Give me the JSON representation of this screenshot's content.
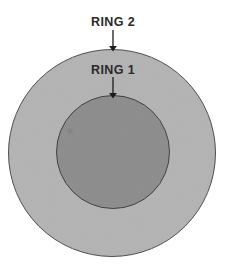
{
  "figure": {
    "type": "concentric-ring-diagram",
    "background_color": "#ffffff",
    "width": 227,
    "height": 266
  },
  "shapes": {
    "outer_ring": {
      "name": "RING 2",
      "fill_color": "#b3b3b3",
      "stroke_color": "#4a4a4a",
      "center_x": 112,
      "center_y": 153,
      "radius": 104
    },
    "inner_ring": {
      "name": "RING 1",
      "fill_color": "#8c8c8c",
      "stroke_color": "#3c3c3c",
      "center_x": 113,
      "center_y": 152,
      "radius": 57
    }
  },
  "annotations": [
    {
      "id": "ring-2",
      "label": "RING 2",
      "label_x": 113,
      "label_y": 26,
      "arrow_x": 113,
      "arrow_start_y": 30,
      "arrow_end_y": 49,
      "arrow_color": "#1c1c1c"
    },
    {
      "id": "ring-1",
      "label": "RING 1",
      "label_x": 113,
      "label_y": 74,
      "arrow_x": 113,
      "arrow_start_y": 77,
      "arrow_end_y": 96,
      "arrow_color": "#1c1c1c"
    }
  ],
  "artifacts": [
    {
      "id": "scan-speck",
      "x": 70,
      "y": 131,
      "radius": 2.6,
      "color": "#7e7e7e"
    }
  ]
}
